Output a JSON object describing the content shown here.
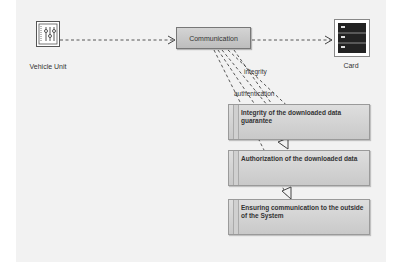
{
  "diagram": {
    "nodes": {
      "vehicle_unit": {
        "label": "Vehicle Unit",
        "icon": "control-sliders-icon"
      },
      "communication": {
        "label": "Communication"
      },
      "card": {
        "label": "Card",
        "icon": "server-rack-icon"
      }
    },
    "requirements": [
      {
        "text": "Integrity of the downloaded data guarantee"
      },
      {
        "text": "Authorization of the downloaded data"
      },
      {
        "text": "Ensuring communication to the outside of the System"
      }
    ],
    "edge_labels": {
      "integrity": "integrity",
      "authentication": "authentication"
    },
    "colors": {
      "box_fill": "#cccccc",
      "line": "#444444",
      "canvas": "#f2f2f2"
    }
  }
}
